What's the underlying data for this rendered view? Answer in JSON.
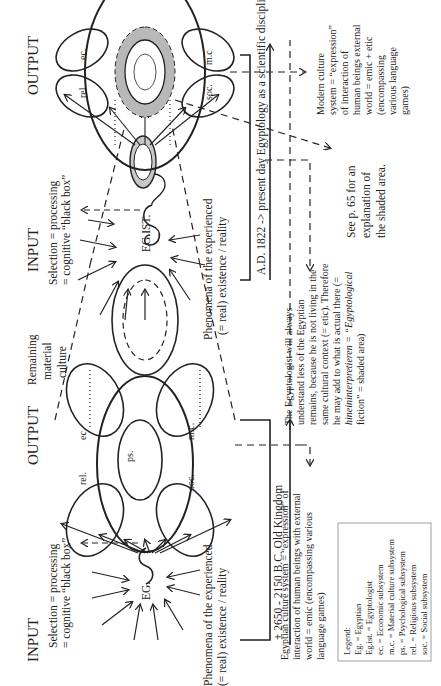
{
  "figure": {
    "orientation": "rotated-90-ccw",
    "labels": {
      "input_1": "INPUT",
      "output_1": "OUTPUT",
      "input_2": "INPUT",
      "output_2": "OUTPUT",
      "selection_1a": "Selection = processing",
      "selection_1b": "= cognitive “black box”",
      "selection_2a": "Selection = processing",
      "selection_2b": "= cognitive “black box”",
      "phenomena_1a": "Phenomena  of the experienced",
      "phenomena_1b": "(= real) existence / reality",
      "phenomena_2a": "Phenomena of the experienced",
      "phenomena_2b": "(= real) existence / reality",
      "eg": "EG.",
      "egist": "EG.IST.",
      "remaining_a": "Remaining",
      "remaining_b": "material",
      "remaining_c": "culture",
      "old_kingdom": "± 2650 - 2150 B.C. Old Kingdom",
      "present_day": "A.D. 1822 -> present day Egyptology as a scientific discipline"
    },
    "subsystems_1": {
      "rel": "rel.",
      "ec": "ec.",
      "ps": "ps.",
      "mc": "m.c.",
      "soc": "soc."
    },
    "subsystems_2": {
      "rel": "rel.",
      "ec": "ec.",
      "mc": "m.c",
      "soc": "soc."
    },
    "egyptian_culture": [
      "Egyptian culture system = “expression” of",
      "interaction of human beings with external",
      "world = emic (encompassing various",
      "language games)"
    ],
    "egyptologist_note": [
      "The Egyptologist will always",
      "understand less of the Egyptian",
      "remains, because he is not living in the",
      "same cultural context (= etic). Therefore",
      "he may add to what is actual there (=",
      "hineininterpretieren = “Egyptological",
      "fiction” = shaded area)"
    ],
    "see_page": [
      "See p. 65 for an",
      "explanation of",
      "the shaded area."
    ],
    "modern_culture": [
      "Modern culture",
      "system = “expression”",
      "of interaction of",
      "human beings external",
      "world = emic + etic",
      "(encompassing",
      "various language",
      "games)"
    ],
    "legend": {
      "title": "Legend:",
      "items": [
        "Eg. = Egyptian",
        "Eg.ist. = Egyptologist",
        "ec. = Economic subsystem",
        "m.c. = Material culture subsystem",
        "ps. = Psychological subsystem",
        "rel. = Religious subsystem",
        "soc. = Social subsystem"
      ]
    },
    "colors": {
      "ink": "#222222",
      "shade": "#b8b8b8",
      "light_shade": "#d8d8d8"
    }
  }
}
